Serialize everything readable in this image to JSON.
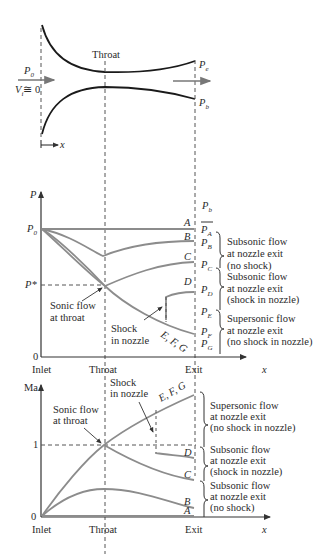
{
  "nozzle": {
    "throat_label": "Throat",
    "inlet_pressure": "P",
    "inlet_pressure_sub": "0",
    "inlet_velocity": "V",
    "inlet_velocity_sub": "i",
    "inlet_velocity_eq": "≅ 0",
    "exit_pressure": "P",
    "exit_pressure_sub": "e",
    "back_pressure": "P",
    "back_pressure_sub": "b",
    "x_axis": "x"
  },
  "pressure_plot": {
    "y_label": "P",
    "y_ticks": {
      "p0": "P",
      "p0_sub": "0",
      "pstar": "P*",
      "zero": "0"
    },
    "x_ticks": [
      "Inlet",
      "Throat",
      "Exit"
    ],
    "x_label": "x",
    "back_pressure_header": "P",
    "back_pressure_header_sub": "b",
    "curve_labels": [
      "A",
      "B",
      "C",
      "D",
      "E, F, G"
    ],
    "pressure_labels": [
      {
        "base": "P",
        "sub": "A"
      },
      {
        "base": "P",
        "sub": "B"
      },
      {
        "base": "P",
        "sub": "C"
      },
      {
        "base": "P",
        "sub": "D"
      },
      {
        "base": "P",
        "sub": "E"
      },
      {
        "base": "P",
        "sub": "F"
      },
      {
        "base": "P",
        "sub": "G"
      }
    ],
    "annotations": {
      "sonic": [
        "Sonic flow",
        "at throat"
      ],
      "shock": [
        "Shock",
        "in nozzle"
      ]
    },
    "regimes": [
      [
        "Subsonic flow",
        "at nozzle exit",
        "(no shock)"
      ],
      [
        "Subsonic flow",
        "at nozzle exit",
        "(shock in nozzle)"
      ],
      [
        "Supersonic flow",
        "at nozzle exit",
        "(no shock in nozzle)"
      ]
    ]
  },
  "mach_plot": {
    "y_label": "Ma",
    "y_ticks": [
      "0",
      "1"
    ],
    "x_ticks": [
      "Inlet",
      "Throat",
      "Exit"
    ],
    "x_label": "x",
    "curve_labels": [
      "A",
      "B",
      "C",
      "D",
      "E, F, G"
    ],
    "annotations": {
      "sonic": [
        "Sonic flow",
        "at throat"
      ],
      "shock": [
        "Shock",
        "in nozzle"
      ]
    },
    "regimes": [
      [
        "Supersonic flow",
        "at nozzle exit",
        "(no shock in nozzle)"
      ],
      [
        "Subsonic flow",
        "at nozzle exit",
        "(shock in nozzle)"
      ],
      [
        "Subsonic flow",
        "at nozzle exit",
        "(no shock)"
      ]
    ]
  },
  "colors": {
    "wall": "#1a1a1a",
    "curve": "#8c8c8c",
    "axis": "#333333",
    "dash": "#555555"
  }
}
